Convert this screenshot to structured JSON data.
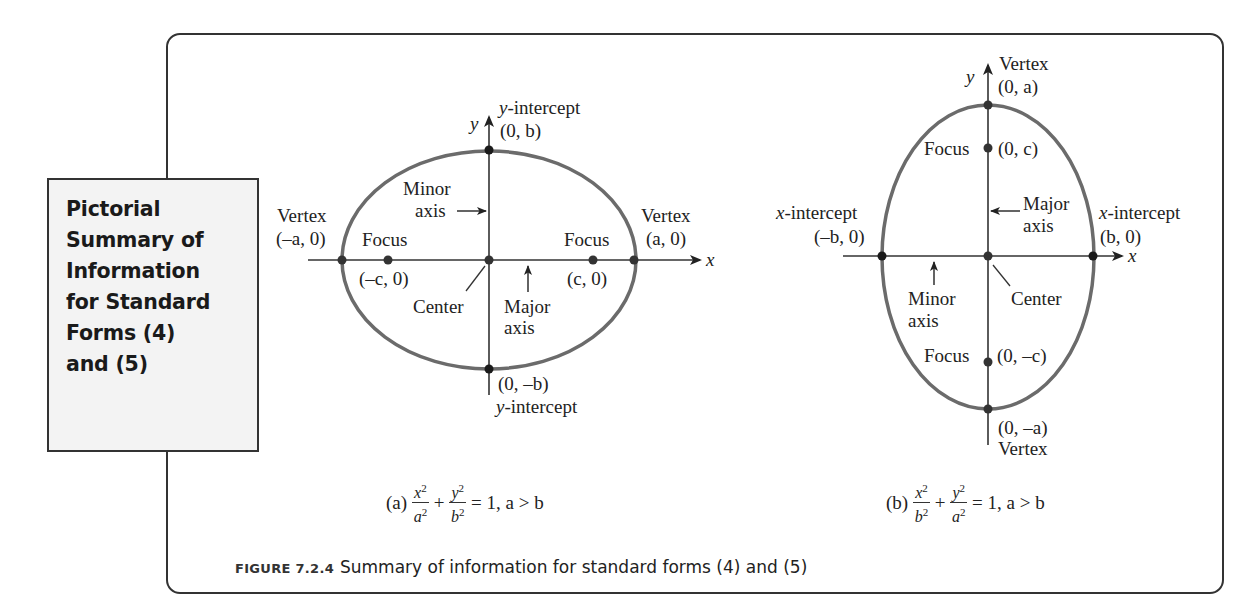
{
  "sidebox": {
    "title": "Pictorial\nSummary of\nInformation\nfor Standard\nForms (4)\nand (5)"
  },
  "colors": {
    "ellipse": "#6b6b6b",
    "axes": "#333333",
    "points": "#1a1a1a",
    "sidebox_bg": "#f3f3f3",
    "frame": "#333333"
  },
  "diagram_a": {
    "axis_x_label": "x",
    "axis_y_label": "y",
    "y_intercept_top_title": "y-intercept",
    "y_intercept_top_coord": "(0, b)",
    "y_intercept_bottom_coord": "(0, –b)",
    "y_intercept_bottom_title": "y-intercept",
    "vertex_left_title": "Vertex",
    "vertex_left_coord": "(–a, 0)",
    "vertex_right_title": "Vertex",
    "vertex_right_coord": "(a, 0)",
    "focus_left_title": "Focus",
    "focus_left_coord": "(–c, 0)",
    "focus_right_title": "Focus",
    "focus_right_coord": "(c, 0)",
    "minor_axis_line1": "Minor",
    "minor_axis_line2": "axis",
    "major_axis_line1": "Major",
    "major_axis_line2": "axis",
    "center_label": "Center",
    "equation_prefix": "(a)",
    "equation_suffix": "= 1, a > b",
    "term1_num": "x",
    "term1_den": "a",
    "term2_num": "y",
    "term2_den": "b",
    "exponent": "2",
    "plus": "+"
  },
  "diagram_b": {
    "axis_x_label": "x",
    "axis_y_label": "y",
    "vertex_top_title": "Vertex",
    "vertex_top_coord": "(0, a)",
    "vertex_bottom_coord": "(0, –a)",
    "vertex_bottom_title": "Vertex",
    "focus_top_title": "Focus",
    "focus_top_coord": "(0, c)",
    "focus_bottom_title": "Focus",
    "focus_bottom_coord": "(0, –c)",
    "x_intercept_left_title": "x-intercept",
    "x_intercept_left_coord": "(–b, 0)",
    "x_intercept_right_title": "x-intercept",
    "x_intercept_right_coord": "(b, 0)",
    "major_axis_line1": "Major",
    "major_axis_line2": "axis",
    "minor_axis_line1": "Minor",
    "minor_axis_line2": "axis",
    "center_label": "Center",
    "equation_prefix": "(b)",
    "equation_suffix": "= 1, a > b",
    "term1_num": "x",
    "term1_den": "b",
    "term2_num": "y",
    "term2_den": "a",
    "exponent": "2",
    "plus": "+"
  },
  "caption": {
    "figure_number": "FIGURE 7.2.4",
    "text": "Summary of information for standard forms (4) and (5)"
  }
}
